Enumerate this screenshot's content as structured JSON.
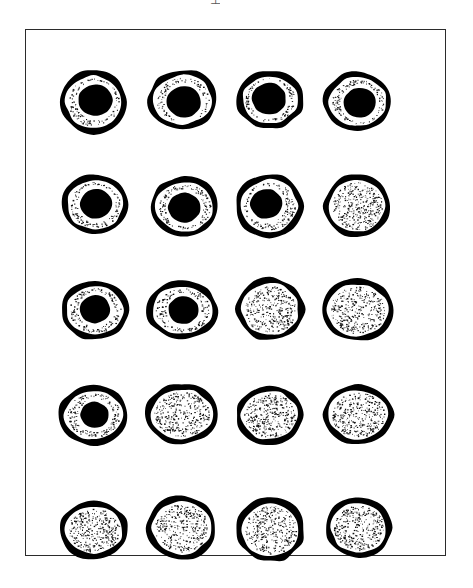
{
  "figure": {
    "title": "",
    "top_artifact_glyph": "⊥",
    "frame": {
      "x": 25,
      "y": 29,
      "width": 421,
      "height": 527,
      "stroke_color": "#2b2b2b",
      "stroke_width": 1.6,
      "fill_color": "#ffffff"
    },
    "style": {
      "background_color": "#ffffff",
      "ink_color": "#000000",
      "membrane_color": "#000000",
      "cytoplasm_color": "#ffffff",
      "stipple_color": "#111111",
      "nucleus_color": "#000000"
    },
    "grid": {
      "rows": 5,
      "columns": 4,
      "column_centers_px": [
        95,
        183,
        270,
        358
      ],
      "row_centers_px": [
        72,
        177,
        281,
        386,
        500
      ]
    },
    "legend_note": "",
    "rows": [
      {
        "index": 1,
        "label": "row-1",
        "nuclei_count": 4,
        "row_top_px": 22,
        "cells": [
          {
            "label": "cell-1-1",
            "has_nucleus": true,
            "nucleus_radius": 17,
            "nucleus_dx": 2,
            "nucleus_dy": -2,
            "shape_seed": 11
          },
          {
            "label": "cell-1-2",
            "has_nucleus": true,
            "nucleus_radius": 17,
            "nucleus_dx": 1,
            "nucleus_dy": 2,
            "shape_seed": 23
          },
          {
            "label": "cell-1-3",
            "has_nucleus": true,
            "nucleus_radius": 17,
            "nucleus_dx": -1,
            "nucleus_dy": -1,
            "shape_seed": 37
          },
          {
            "label": "cell-1-4",
            "has_nucleus": true,
            "nucleus_radius": 16,
            "nucleus_dx": 2,
            "nucleus_dy": 1,
            "shape_seed": 51
          }
        ]
      },
      {
        "index": 2,
        "label": "row-2",
        "nuclei_count": 3,
        "row_top_px": 127,
        "cells": [
          {
            "label": "cell-2-1",
            "has_nucleus": true,
            "nucleus_radius": 16,
            "nucleus_dx": 1,
            "nucleus_dy": -1,
            "shape_seed": 13
          },
          {
            "label": "cell-2-2",
            "has_nucleus": true,
            "nucleus_radius": 16,
            "nucleus_dx": 0,
            "nucleus_dy": 1,
            "shape_seed": 29
          },
          {
            "label": "cell-2-3",
            "has_nucleus": true,
            "nucleus_radius": 16,
            "nucleus_dx": -3,
            "nucleus_dy": -2,
            "shape_seed": 41
          },
          {
            "label": "cell-2-4",
            "has_nucleus": false,
            "nucleus_radius": 0,
            "nucleus_dx": 0,
            "nucleus_dy": 0,
            "shape_seed": 59
          }
        ]
      },
      {
        "index": 3,
        "label": "row-3",
        "nuclei_count": 2,
        "row_top_px": 231,
        "cells": [
          {
            "label": "cell-3-1",
            "has_nucleus": true,
            "nucleus_radius": 15,
            "nucleus_dx": 0,
            "nucleus_dy": -1,
            "shape_seed": 17
          },
          {
            "label": "cell-3-2",
            "has_nucleus": true,
            "nucleus_radius": 15,
            "nucleus_dx": 1,
            "nucleus_dy": 0,
            "shape_seed": 31
          },
          {
            "label": "cell-3-3",
            "has_nucleus": false,
            "nucleus_radius": 0,
            "nucleus_dx": 0,
            "nucleus_dy": 0,
            "shape_seed": 43
          },
          {
            "label": "cell-3-4",
            "has_nucleus": false,
            "nucleus_radius": 0,
            "nucleus_dx": 0,
            "nucleus_dy": 0,
            "shape_seed": 61
          }
        ]
      },
      {
        "index": 4,
        "label": "row-4",
        "nuclei_count": 1,
        "row_top_px": 336,
        "cells": [
          {
            "label": "cell-4-1",
            "has_nucleus": true,
            "nucleus_radius": 14,
            "nucleus_dx": 1,
            "nucleus_dy": 0,
            "shape_seed": 19
          },
          {
            "label": "cell-4-2",
            "has_nucleus": false,
            "nucleus_radius": 0,
            "nucleus_dx": 0,
            "nucleus_dy": 0,
            "shape_seed": 33
          },
          {
            "label": "cell-4-3",
            "has_nucleus": false,
            "nucleus_radius": 0,
            "nucleus_dx": 0,
            "nucleus_dy": 0,
            "shape_seed": 47
          },
          {
            "label": "cell-4-4",
            "has_nucleus": false,
            "nucleus_radius": 0,
            "nucleus_dx": 0,
            "nucleus_dy": 0,
            "shape_seed": 67
          }
        ]
      },
      {
        "index": 5,
        "label": "row-5",
        "nuclei_count": 0,
        "row_top_px": 450,
        "cells": [
          {
            "label": "cell-5-1",
            "has_nucleus": false,
            "nucleus_radius": 0,
            "nucleus_dx": 0,
            "nucleus_dy": 0,
            "shape_seed": 21
          },
          {
            "label": "cell-5-2",
            "has_nucleus": false,
            "nucleus_radius": 0,
            "nucleus_dx": 0,
            "nucleus_dy": 0,
            "shape_seed": 35
          },
          {
            "label": "cell-5-3",
            "has_nucleus": false,
            "nucleus_radius": 0,
            "nucleus_dx": 0,
            "nucleus_dy": 0,
            "shape_seed": 53
          },
          {
            "label": "cell-5-4",
            "has_nucleus": false,
            "nucleus_radius": 0,
            "nucleus_dx": 0,
            "nucleus_dy": 0,
            "shape_seed": 71
          }
        ]
      }
    ]
  }
}
